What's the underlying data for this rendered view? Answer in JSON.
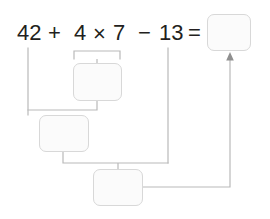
{
  "worksheet": {
    "title": "order-of-operations-worksheet",
    "equation_text": "42 + 4 × 7 − 13 =",
    "colors": {
      "text": "#231f20",
      "box_fill": "#fbfbfb",
      "box_border": "#d8d8d8",
      "connector": "#b9b9b9",
      "page_background": "#ffffff"
    },
    "expression": {
      "tokens": [
        {
          "id": "operand-42",
          "label": "42",
          "x": 17,
          "y": 22
        },
        {
          "id": "operator-plus",
          "label": "+",
          "x": 48,
          "y": 22
        },
        {
          "id": "operand-4",
          "label": "4",
          "x": 74,
          "y": 22
        },
        {
          "id": "operator-times",
          "label": "×",
          "x": 93,
          "y": 23
        },
        {
          "id": "operand-7",
          "label": "7",
          "x": 113,
          "y": 22
        },
        {
          "id": "operator-minus",
          "label": "−",
          "x": 138,
          "y": 22
        },
        {
          "id": "operand-13",
          "label": "13",
          "x": 159,
          "y": 22
        },
        {
          "id": "operator-equals",
          "label": "=",
          "x": 188,
          "y": 22
        }
      ]
    },
    "boxes": [
      {
        "id": "answer-box-final",
        "name": "final-answer-box",
        "value": "",
        "placeholder": "",
        "x": 207,
        "y": 14,
        "w": 44,
        "h": 37,
        "step": 4,
        "describes": "final result of 42 + 4 × 7 − 13"
      },
      {
        "id": "answer-box-multiply",
        "name": "step1-multiplication-box",
        "value": "",
        "placeholder": "",
        "x": 73,
        "y": 63,
        "w": 49,
        "h": 38,
        "step": 1,
        "describes": "result of 4 × 7"
      },
      {
        "id": "answer-box-add",
        "name": "step2-addition-box",
        "value": "",
        "placeholder": "",
        "x": 39,
        "y": 115,
        "w": 50,
        "h": 37,
        "step": 2,
        "describes": "result of 42 + (4 × 7)"
      },
      {
        "id": "answer-box-subtract",
        "name": "step3-subtraction-box",
        "value": "",
        "placeholder": "",
        "x": 93,
        "y": 169,
        "w": 50,
        "h": 37,
        "step": 3,
        "describes": "result of (42 + 28) − 13"
      }
    ],
    "connectors": [
      {
        "id": "bracket-4-times-7",
        "name": "grouping-bracket-multiply"
      },
      {
        "id": "line-multiply-to-add",
        "name": "connector-multiply-to-add"
      },
      {
        "id": "line-42-to-add",
        "name": "connector-operand42-to-add"
      },
      {
        "id": "line-add-to-subtract",
        "name": "connector-add-to-subtract"
      },
      {
        "id": "line-13-to-subtract",
        "name": "connector-operand13-to-subtract"
      },
      {
        "id": "arrow-subtract-to-final",
        "name": "connector-arrow-to-final-answer"
      }
    ]
  }
}
